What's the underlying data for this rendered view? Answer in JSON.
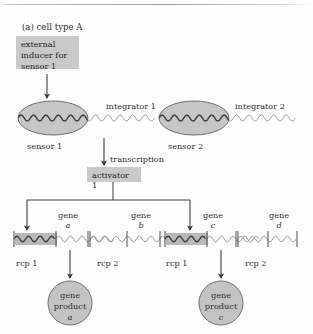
{
  "figure": {
    "caption": "(a) cell type A",
    "panel_label": "(a)",
    "panel_title": "cell type A"
  },
  "inducer_box": {
    "line1": "external",
    "line2": "inducer for",
    "line3": "sensor 1",
    "fill": "#c9c9c9"
  },
  "integrators": [
    {
      "id": "integrator-1",
      "label": "integrator 1",
      "sensor_label": "sensor 1"
    },
    {
      "id": "integrator-2",
      "label": "integrator 2",
      "sensor_label": "sensor 2"
    }
  ],
  "transcription": {
    "label": "transcription"
  },
  "activator_box": {
    "label": "activator 1",
    "fill": "#c9c9c9"
  },
  "genes": [
    {
      "word": "gene",
      "name": "a"
    },
    {
      "word": "gene",
      "name": "b"
    },
    {
      "word": "gene",
      "name": "c"
    },
    {
      "word": "gene",
      "name": "d"
    }
  ],
  "rcp_labels": [
    {
      "label": "rcp 1"
    },
    {
      "label": "rcp 2"
    },
    {
      "label": "rcp 1"
    },
    {
      "label": "rcp 2"
    }
  ],
  "gene_products": [
    {
      "line1": "gene",
      "line2": "product",
      "line3": "a"
    },
    {
      "line1": "gene",
      "line2": "product",
      "line3": "c"
    }
  ],
  "colors": {
    "box_fill": "#c9c9c9",
    "ellipse_fill": "#c6c6c6",
    "ellipse_stroke": "#6f6f6f",
    "circle_fill": "#c3c3c3",
    "circle_stroke": "#6f6f6f",
    "promoter_fill": "#b9b9b9",
    "dna_light": "#9d9d9d",
    "dna_dark": "#3a3a3a",
    "arrow": "#3b3b3b",
    "text": "#2e2e2e"
  }
}
